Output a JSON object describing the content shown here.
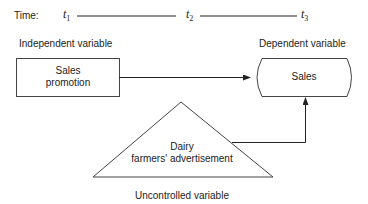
{
  "timeline": {
    "label": "Time:",
    "points": [
      {
        "t": "t",
        "sub": "1"
      },
      {
        "t": "t",
        "sub": "2"
      },
      {
        "t": "t",
        "sub": "3"
      }
    ]
  },
  "nodes": {
    "independent": {
      "caption": "Independent variable",
      "line1": "Sales",
      "line2": "promotion"
    },
    "dependent": {
      "caption": "Dependent variable",
      "label": "Sales"
    },
    "uncontrolled": {
      "caption": "Uncontrolled variable",
      "line1": "Dairy",
      "line2": "farmers' advertisement"
    }
  },
  "colors": {
    "stroke": "#222222",
    "text": "#222222",
    "background": "#ffffff"
  }
}
